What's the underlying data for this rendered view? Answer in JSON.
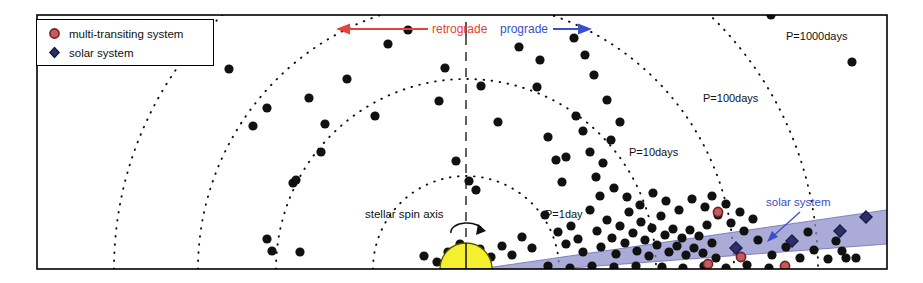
{
  "figure": {
    "frame": {
      "x": 36,
      "y": 14,
      "w": 852,
      "h": 256
    },
    "background": "#ffffff",
    "border_color": "#000000"
  },
  "legend": {
    "items": [
      {
        "marker": "circle-marker-red",
        "label": "multi-transiting system",
        "fill": "#c25b5b",
        "edge": "#7a1f1f"
      },
      {
        "marker": "diamond-marker-blue",
        "label": "solar system",
        "fill": "#2d2f6b",
        "edge": "#14163f"
      }
    ]
  },
  "annotations": {
    "retrograde": {
      "text": "retrograde",
      "color": "#e8403a",
      "arrow": "left-arrow-icon"
    },
    "prograde": {
      "text": "prograde",
      "color": "#3b4ecb",
      "arrow": "right-arrow-icon"
    },
    "spin_axis": {
      "text": "stellar spin axis",
      "color": "#111111"
    },
    "solar_system": {
      "text": "solar system",
      "color": "#3b4ecb"
    }
  },
  "period_arcs": [
    {
      "label": "P=1day",
      "radius": 93,
      "label_x": 545,
      "label_y": 208
    },
    {
      "label": "P=10days",
      "radius": 190,
      "label_x": 629,
      "label_y": 146
    },
    {
      "label": "P=100days",
      "radius": 268,
      "label_x": 703,
      "label_y": 92
    },
    {
      "label": "P=1000days",
      "radius": 352,
      "label_x": 786,
      "label_y": 30
    }
  ],
  "star": {
    "name": "star-hemisphere",
    "fill": "#f5f02f",
    "edge": "#555500",
    "cx": 466,
    "cy": 269,
    "r": 26
  },
  "solar_system_band": {
    "fill": "#8b8ac8",
    "opacity": 0.72,
    "edge": "#6d6cb5"
  },
  "chart_data": {
    "type": "scatter",
    "title": "",
    "xlabel": "",
    "ylabel": "",
    "grid": "dotted-polar-arcs",
    "legend_position": "top-left",
    "origin": {
      "x": 466,
      "y": 269
    },
    "radial_scale": "log-period",
    "radial_ticks": [
      {
        "label": "P=1day",
        "radius": 93
      },
      {
        "label": "P=10days",
        "radius": 190
      },
      {
        "label": "P=100days",
        "radius": 268
      },
      {
        "label": "P=1000days",
        "radius": 352
      }
    ],
    "series": [
      {
        "name": "transiting planets",
        "marker": "circle",
        "color": "#111111",
        "points": [
          [
            206,
            25
          ],
          [
            229,
            69
          ],
          [
            267,
            108
          ],
          [
            253,
            126
          ],
          [
            293,
            183
          ],
          [
            267,
            239
          ],
          [
            272,
            251
          ],
          [
            300,
            252
          ],
          [
            296,
            180
          ],
          [
            321,
            152
          ],
          [
            325,
            124
          ],
          [
            309,
            98
          ],
          [
            347,
            79
          ],
          [
            375,
            116
          ],
          [
            388,
            44
          ],
          [
            408,
            30
          ],
          [
            445,
            68
          ],
          [
            439,
            101
          ],
          [
            456,
            161
          ],
          [
            469,
            181
          ],
          [
            481,
            86
          ],
          [
            498,
            122
          ],
          [
            476,
            190
          ],
          [
            519,
            47
          ],
          [
            537,
            87
          ],
          [
            540,
            60
          ],
          [
            548,
            137
          ],
          [
            556,
            160
          ],
          [
            562,
            182
          ],
          [
            566,
            157
          ],
          [
            576,
            116
          ],
          [
            583,
            131
          ],
          [
            590,
            152
          ],
          [
            596,
            177
          ],
          [
            603,
            163
          ],
          [
            611,
            140
          ],
          [
            545,
            215
          ],
          [
            558,
            232
          ],
          [
            566,
            244
          ],
          [
            571,
            226
          ],
          [
            578,
            239
          ],
          [
            583,
            252
          ],
          [
            590,
            210
          ],
          [
            597,
            231
          ],
          [
            601,
            247
          ],
          [
            607,
            220
          ],
          [
            612,
            238
          ],
          [
            616,
            254
          ],
          [
            620,
            226
          ],
          [
            625,
            243
          ],
          [
            629,
            212
          ],
          [
            633,
            233
          ],
          [
            637,
            251
          ],
          [
            641,
            222
          ],
          [
            645,
            240
          ],
          [
            649,
            256
          ],
          [
            652,
            228
          ],
          [
            657,
            245
          ],
          [
            661,
            216
          ],
          [
            665,
            235
          ],
          [
            669,
            252
          ],
          [
            673,
            229
          ],
          [
            677,
            246
          ],
          [
            682,
            238
          ],
          [
            686,
            255
          ],
          [
            690,
            230
          ],
          [
            694,
            248
          ],
          [
            699,
            236
          ],
          [
            703,
            253
          ],
          [
            707,
            225
          ],
          [
            712,
            243
          ],
          [
            716,
            258
          ],
          [
            600,
            196
          ],
          [
            614,
            188
          ],
          [
            627,
            197
          ],
          [
            640,
            205
          ],
          [
            653,
            193
          ],
          [
            666,
            201
          ],
          [
            679,
            210
          ],
          [
            692,
            199
          ],
          [
            705,
            207
          ],
          [
            718,
            215
          ],
          [
            731,
            223
          ],
          [
            744,
            231
          ],
          [
            532,
            248
          ],
          [
            522,
            237
          ],
          [
            512,
            255
          ],
          [
            502,
            246
          ],
          [
            491,
            257
          ],
          [
            480,
            249
          ],
          [
            758,
            240
          ],
          [
            772,
            255
          ],
          [
            786,
            247
          ],
          [
            800,
            258
          ],
          [
            814,
            250
          ],
          [
            828,
            259
          ],
          [
            842,
            251
          ],
          [
            856,
            258
          ],
          [
            712,
            196
          ],
          [
            726,
            204
          ],
          [
            740,
            212
          ],
          [
            753,
            219
          ],
          [
            662,
            267
          ],
          [
            683,
            268
          ],
          [
            704,
            266
          ],
          [
            726,
            268
          ],
          [
            747,
            265
          ],
          [
            769,
            268
          ],
          [
            636,
            266
          ],
          [
            614,
            267
          ],
          [
            592,
            266
          ],
          [
            570,
            268
          ],
          [
            548,
            266
          ],
          [
            771,
            15
          ],
          [
            852,
            62
          ],
          [
            836,
            241
          ],
          [
            846,
            258
          ],
          [
            808,
            232
          ],
          [
            620,
            122
          ],
          [
            607,
            100
          ],
          [
            594,
            75
          ],
          [
            585,
            55
          ],
          [
            574,
            38
          ],
          [
            448,
            252
          ],
          [
            460,
            244
          ],
          [
            437,
            262
          ],
          [
            424,
            256
          ]
        ]
      },
      {
        "name": "multi-transiting system",
        "marker": "circle",
        "fill": "#c25b5b",
        "edge": "#7a1f1f",
        "points": [
          [
            718,
            212
          ],
          [
            708,
            264
          ],
          [
            785,
            266
          ],
          [
            741,
            257
          ]
        ]
      },
      {
        "name": "solar system",
        "marker": "diamond",
        "fill": "#2d2f6b",
        "edge": "#14163f",
        "points": [
          [
            736,
            248
          ],
          [
            792,
            241
          ],
          [
            840,
            231
          ],
          [
            866,
            217
          ]
        ]
      }
    ]
  }
}
